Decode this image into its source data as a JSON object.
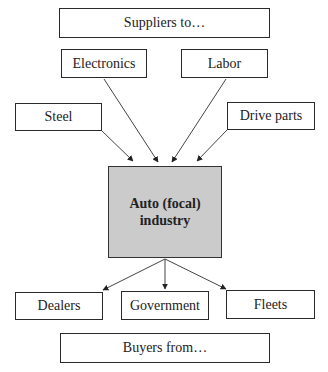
{
  "diagram": {
    "header": {
      "label": "Suppliers to…"
    },
    "suppliers": [
      {
        "id": "electronics",
        "label": "Electronics"
      },
      {
        "id": "labor",
        "label": "Labor"
      },
      {
        "id": "steel",
        "label": "Steel"
      },
      {
        "id": "drive-parts",
        "label": "Drive parts"
      }
    ],
    "focal": {
      "line1": "Auto (focal)",
      "line2": "industry",
      "fill": "#cbcbcb"
    },
    "buyers": [
      {
        "id": "dealers",
        "label": "Dealers"
      },
      {
        "id": "government",
        "label": "Government"
      },
      {
        "id": "fleets",
        "label": "Fleets"
      }
    ],
    "footer": {
      "label": "Buyers from…"
    },
    "edges": [
      {
        "from": "electronics",
        "to": "focal"
      },
      {
        "from": "labor",
        "to": "focal"
      },
      {
        "from": "steel",
        "to": "focal"
      },
      {
        "from": "drive-parts",
        "to": "focal"
      },
      {
        "from": "focal",
        "to": "dealers"
      },
      {
        "from": "focal",
        "to": "government"
      },
      {
        "from": "focal",
        "to": "fleets"
      }
    ]
  }
}
